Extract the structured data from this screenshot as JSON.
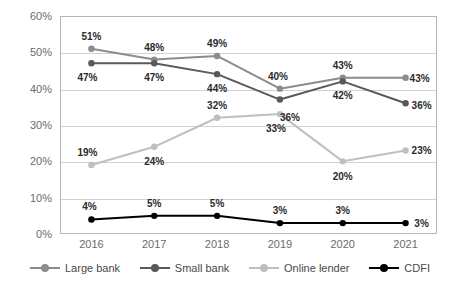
{
  "chart_data": {
    "type": "line",
    "title": "",
    "xlabel": "",
    "ylabel": "",
    "categories": [
      "2016",
      "2017",
      "2018",
      "2019",
      "2020",
      "2021"
    ],
    "ylim": [
      0,
      60
    ],
    "yticks": [
      "0%",
      "10%",
      "20%",
      "30%",
      "40%",
      "50%",
      "60%"
    ],
    "ytick_values": [
      0,
      10,
      20,
      30,
      40,
      50,
      60
    ],
    "grid": true,
    "legend_position": "bottom",
    "series": [
      {
        "name": "Large bank",
        "color": "#8c8c8c",
        "values": [
          51,
          48,
          49,
          40,
          43,
          43
        ],
        "labels": [
          "51%",
          "48%",
          "49%",
          "40%",
          "43%",
          "43%"
        ]
      },
      {
        "name": "Small bank",
        "color": "#595959",
        "values": [
          47,
          47,
          44,
          37,
          42,
          36
        ],
        "labels": [
          "47%",
          "47%",
          "44%",
          "",
          "42%",
          "36%"
        ]
      },
      {
        "name": "Online lender",
        "color": "#bfbfbf",
        "values": [
          19,
          24,
          32,
          33,
          20,
          23
        ],
        "labels": [
          "19%",
          "24%",
          "32%",
          "33%",
          "20%",
          "23%"
        ]
      },
      {
        "name": "CDFI",
        "color": "#000000",
        "values": [
          4,
          5,
          5,
          3,
          3,
          3
        ],
        "labels": [
          "4%",
          "5%",
          "5%",
          "3%",
          "3%",
          "3%"
        ]
      }
    ],
    "extra_labels": [
      {
        "text": "36%",
        "x": 290,
        "y": 117
      }
    ]
  }
}
